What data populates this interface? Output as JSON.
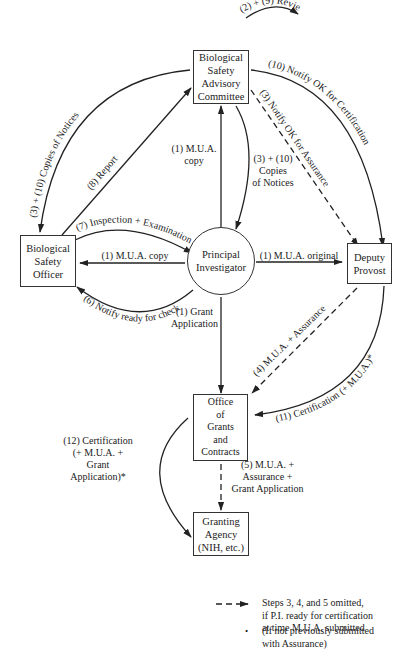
{
  "nodes": {
    "bsac": "Biological\nSafety\nAdvisory\nCommittee",
    "bso": "Biological\nSafety\nOfficer",
    "pi": "Principal\nInvestigator",
    "dp": "Deputy\nProvost",
    "ogc": "Office\nof\nGrants\nand\nContracts",
    "ga": "Granting\nAgency\n(NIH, etc.)"
  },
  "edges": {
    "review": "(2) + (9) Review",
    "copies_left": "(3) + (10) Copies of Notices",
    "report": "(8) Report",
    "mua_copy_bsac": "(1) M.U.A.\ncopy",
    "copies_center": "(3) + (10)\nCopies\nof Notices",
    "notify_cert": "(10) Notify OK for Certification",
    "notify_assurance": "(3) Notify OK for Assurance",
    "inspection": "(7) Inspection + Examination",
    "mua_copy_bso": "(1) M.U.A. copy",
    "mua_original": "(1) M.U.A. original",
    "notify_ready": "(6) Notify ready for check",
    "grant_app": "(1) Grant\nApplication",
    "mua_assurance": "(4) M.U.A. + Assurance",
    "cert_11": "(11) Certification (+ M.U.A.)*",
    "cert_12": "(12) Certification\n(+ M.U.A. +\nGrant Application)*",
    "step5": "(5) M.U.A. +\nAssurance +\nGrant Application"
  },
  "legend": {
    "dashed": "Steps 3, 4, and 5 omitted,\nif P.I. ready for certification\nat time M.U.A. submitted",
    "asterisk": "(If not previously submitted\nwith Assurance)",
    "asterisk_symbol": "•"
  }
}
